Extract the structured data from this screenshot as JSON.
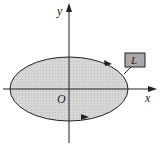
{
  "diagram": {
    "axes": {
      "x_label": "x",
      "y_label": "y",
      "origin_label": "O"
    },
    "curve_label": "L",
    "colors": {
      "fill": "#d4d4d4",
      "stroke": "#222222",
      "label_box": "#a9a9a9"
    }
  }
}
